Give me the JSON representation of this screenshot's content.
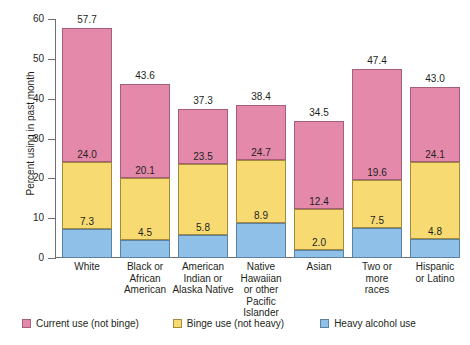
{
  "chart_data": {
    "type": "bar",
    "stacked": true,
    "title": "",
    "xlabel": "",
    "ylabel": "Percent using in past month",
    "ylim": [
      0,
      60
    ],
    "yticks": [
      "0",
      "10",
      "20",
      "30",
      "40",
      "50",
      "60"
    ],
    "grid": false,
    "legend_position": "bottom",
    "categories": [
      "White",
      "Black or African American",
      "American Indian or Alaska Native",
      "Native Hawaiian or other Pacific Islander",
      "Asian",
      "Two or more races",
      "Hispanic or Latino"
    ],
    "category_lines": [
      [
        "White"
      ],
      [
        "Black or",
        "African",
        "American"
      ],
      [
        "American",
        "Indian or",
        "Alaska Native"
      ],
      [
        "Native",
        "Hawaiian",
        "or other",
        "Pacific",
        "Islander"
      ],
      [
        "Asian"
      ],
      [
        "Two or",
        "more",
        "races"
      ],
      [
        "Hispanic",
        "or Latino"
      ]
    ],
    "series": [
      {
        "name": "Heavy alcohol use",
        "color": "#8fc0e8",
        "values": [
          7.3,
          4.5,
          5.8,
          8.9,
          2.0,
          7.5,
          4.8
        ]
      },
      {
        "name": "Binge use (not heavy)",
        "color": "#f7db72",
        "values": [
          16.7,
          15.6,
          17.7,
          15.8,
          10.4,
          12.1,
          19.3
        ]
      },
      {
        "name": "Current use (not binge)",
        "color": "#e589ab",
        "values": [
          33.7,
          23.5,
          13.8,
          13.7,
          22.1,
          27.8,
          18.9
        ]
      }
    ],
    "cumulative_labels": {
      "heavy": [
        "7.3",
        "4.5",
        "5.8",
        "8.9",
        "2.0",
        "7.5",
        "4.8"
      ],
      "binge": [
        "24.0",
        "20.1",
        "23.5",
        "24.7",
        "12.4",
        "19.6",
        "24.1"
      ],
      "total": [
        "57.7",
        "43.6",
        "37.3",
        "38.4",
        "34.5",
        "47.4",
        "43.0"
      ]
    }
  },
  "legend": {
    "items": [
      {
        "label": "Current use (not binge)",
        "swatch": "pink"
      },
      {
        "label": "Binge use (not heavy)",
        "swatch": "yellow"
      },
      {
        "label": "Heavy alcohol use",
        "swatch": "blue"
      }
    ]
  }
}
